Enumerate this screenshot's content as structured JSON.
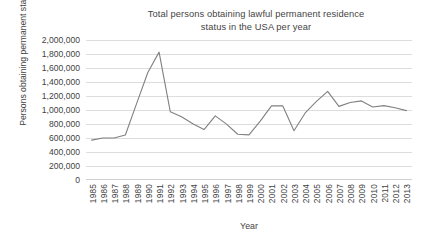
{
  "chart_data": {
    "type": "line",
    "title": "Total persons obtaining lawful permanent residence status in the USA per year",
    "title_line1": "Total persons obtaining lawful permanent residence",
    "title_line2": "status in the USA per year",
    "xlabel": "Year",
    "ylabel": "Persons obtaining permanent status",
    "ylim": [
      0,
      2000000
    ],
    "ytick_values": [
      2000000,
      1800000,
      1600000,
      1400000,
      1200000,
      1000000,
      800000,
      600000,
      400000,
      200000,
      0
    ],
    "ytick_labels": [
      "2,000,000",
      "1,800,000",
      "1,600,000",
      "1,400,000",
      "1,200,000",
      "1,000,000",
      "800,000",
      "600,000",
      "400,000",
      "200,000",
      "0"
    ],
    "grid": true,
    "legend": false,
    "line_color": "#808080",
    "categories": [
      1985,
      1986,
      1987,
      1988,
      1989,
      1990,
      1991,
      1992,
      1993,
      1994,
      1995,
      1996,
      1997,
      1998,
      1999,
      2000,
      2001,
      2002,
      2003,
      2004,
      2005,
      2006,
      2007,
      2008,
      2009,
      2010,
      2011,
      2012,
      2013
    ],
    "tick_labels": [
      "1985",
      "1986",
      "1987",
      "1988",
      "1989",
      "1990",
      "1991",
      "1992",
      "1993",
      "1994",
      "1995",
      "1996",
      "1997",
      "1998",
      "1999",
      "2000",
      "2001",
      "2002",
      "2003",
      "2004",
      "2005",
      "2006",
      "2007",
      "2008",
      "2009",
      "2010",
      "2011",
      "2012",
      "2013"
    ],
    "values": [
      570000,
      601000,
      601000,
      643000,
      1091000,
      1536000,
      1827000,
      974000,
      904000,
      804000,
      721000,
      916000,
      798000,
      654000,
      645000,
      841000,
      1059000,
      1060000,
      704000,
      958000,
      1122000,
      1266000,
      1052000,
      1107000,
      1130000,
      1043000,
      1062000,
      1031000,
      991000
    ]
  }
}
